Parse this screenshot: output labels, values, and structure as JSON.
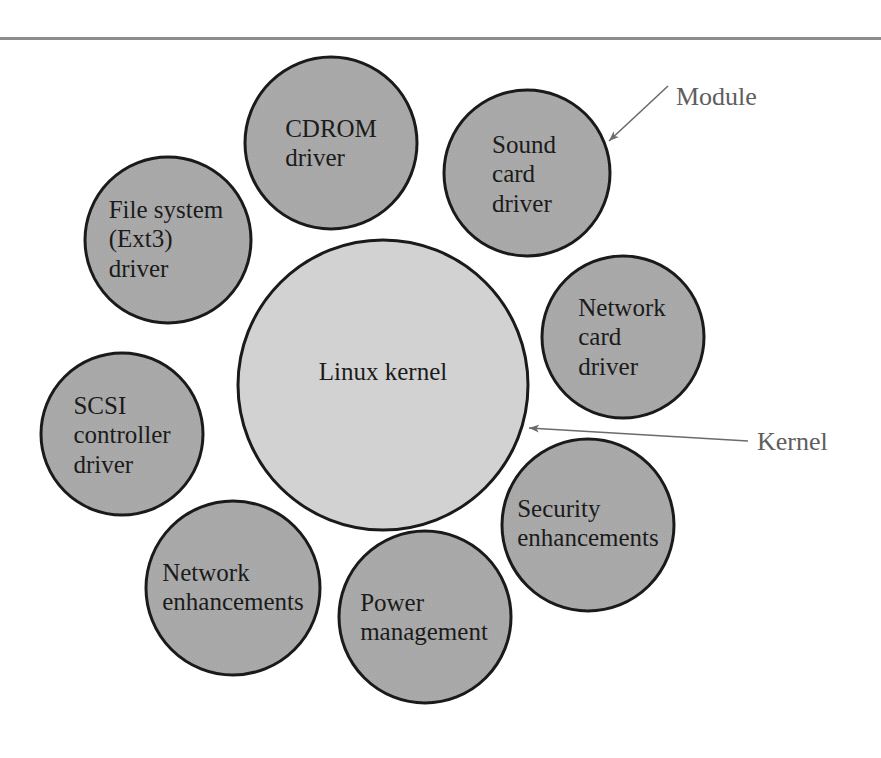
{
  "page": {
    "width": 881,
    "height": 758,
    "background": "#ffffff",
    "rule_color": "#8d8d8d"
  },
  "colors": {
    "module_circle_fill": "#a9a9a9",
    "kernel_circle_fill": "#d2d2d2",
    "circle_stroke": "#1a1a1a",
    "node_text": "#1b1b1b",
    "callout_text": "#5e5e5e",
    "callout_line": "#6b6b6b"
  },
  "diagram": {
    "type": "concentric-module-diagram",
    "kernel": {
      "id": "linux-kernel",
      "label": "Linux kernel",
      "cx": 383,
      "cy": 385,
      "r": 145,
      "fill": "#d2d2d2"
    },
    "modules": [
      {
        "id": "cdrom-driver",
        "label": "CDROM\ndriver",
        "cx": 331,
        "cy": 143,
        "r": 86,
        "fill": "#a9a9a9"
      },
      {
        "id": "sound-card-driver",
        "label": "Sound\ncard\ndriver",
        "cx": 527,
        "cy": 173,
        "r": 83,
        "fill": "#a9a9a9"
      },
      {
        "id": "file-system-ext3-driver",
        "label": "File system\n(Ext3)\ndriver",
        "cx": 168,
        "cy": 240,
        "r": 83,
        "fill": "#a9a9a9"
      },
      {
        "id": "network-card-driver",
        "label": "Network\ncard\ndriver",
        "cx": 623,
        "cy": 337,
        "r": 81,
        "fill": "#a9a9a9"
      },
      {
        "id": "scsi-controller-driver",
        "label": "SCSI\ncontroller\ndriver",
        "cx": 122,
        "cy": 434,
        "r": 81,
        "fill": "#a9a9a9"
      },
      {
        "id": "security-enhancements",
        "label": "Security\nenhancements",
        "cx": 588,
        "cy": 525,
        "r": 86,
        "fill": "#a9a9a9"
      },
      {
        "id": "network-enhancements",
        "label": "Network\nenhancements",
        "cx": 233,
        "cy": 588,
        "r": 87,
        "fill": "#a9a9a9"
      },
      {
        "id": "power-management",
        "label": "Power\nmanagement",
        "cx": 425,
        "cy": 617,
        "r": 86,
        "fill": "#a9a9a9"
      }
    ],
    "callouts": [
      {
        "id": "module-callout",
        "label": "Module",
        "label_x": 676,
        "label_y": 96,
        "line": {
          "x1": 668,
          "y1": 86,
          "x2": 609,
          "y2": 141
        },
        "points_to": "sound-card-driver"
      },
      {
        "id": "kernel-callout",
        "label": "Kernel",
        "label_x": 757,
        "label_y": 441,
        "line": {
          "x1": 748,
          "y1": 441,
          "x2": 529,
          "y2": 428
        },
        "points_to": "linux-kernel"
      }
    ]
  }
}
